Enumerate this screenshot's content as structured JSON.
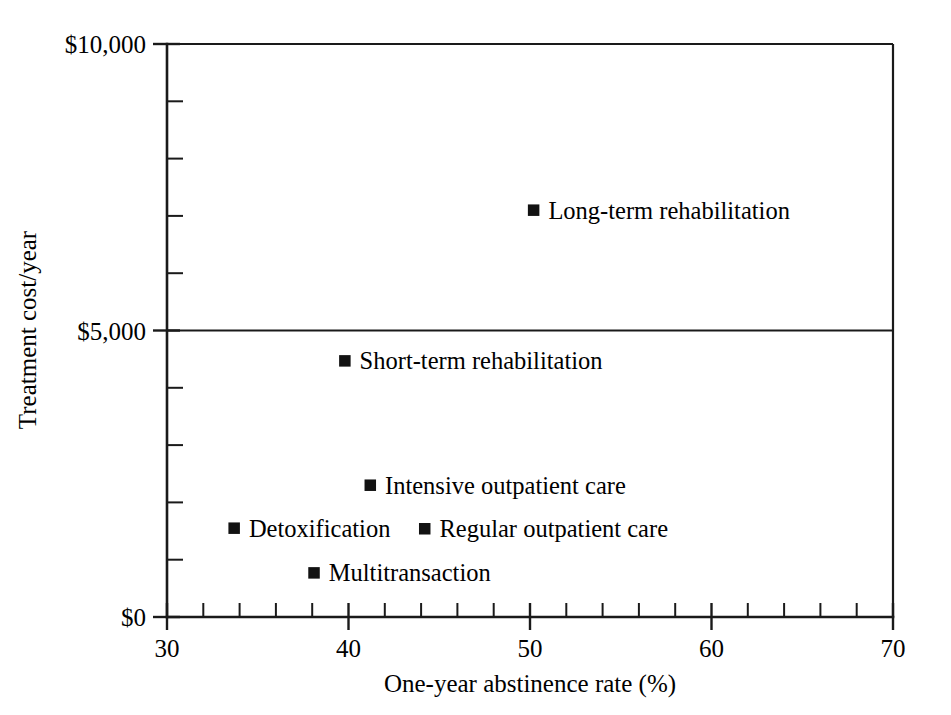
{
  "chart_data": {
    "type": "scatter",
    "title": "",
    "xlabel": "One-year abstinence rate (%)",
    "ylabel": "Treatment cost/year",
    "xlim": [
      30,
      70
    ],
    "ylim": [
      0,
      10000
    ],
    "grid": "horizontal-at-5000",
    "legend": "none-inline-labels",
    "x_ticks_major": [
      30,
      40,
      50,
      60,
      70
    ],
    "x_tick_labels": [
      "30",
      "40",
      "50",
      "60",
      "70"
    ],
    "x_tick_minor_step": 2,
    "y_ticks_major": [
      0,
      5000,
      10000
    ],
    "y_tick_labels": [
      "$0",
      "$5,000",
      "$10,000"
    ],
    "y_tick_minor_step": 1000,
    "points": [
      {
        "label": "Long-term rehabilitation",
        "x": 50.2,
        "y": 7100,
        "marker": "filled-square"
      },
      {
        "label": "Short-term rehabilitation",
        "x": 39.8,
        "y": 4470,
        "marker": "filled-square"
      },
      {
        "label": "Intensive outpatient care",
        "x": 41.2,
        "y": 2300,
        "marker": "filled-square"
      },
      {
        "label": "Detoxification",
        "x": 33.7,
        "y": 1550,
        "marker": "filled-square"
      },
      {
        "label": "Regular outpatient care",
        "x": 44.2,
        "y": 1540,
        "marker": "filled-square"
      },
      {
        "label": "Multitransaction",
        "x": 38.1,
        "y": 770,
        "marker": "filled-square"
      }
    ],
    "colors": {
      "marker": "#121212",
      "axis": "#1a1a1a",
      "background": "#ffffff",
      "text": "#000000"
    }
  }
}
